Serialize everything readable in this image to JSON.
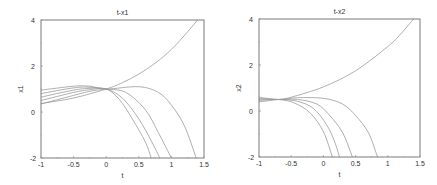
{
  "chart_data": [
    {
      "type": "line",
      "title": "t-x1",
      "xlabel": "t",
      "ylabel": "x1",
      "xlim": [
        -1,
        1.5
      ],
      "ylim": [
        -2,
        4
      ],
      "xticks": [
        "-1",
        "-0.5",
        "0",
        "0.5",
        "1",
        "1.5"
      ],
      "yticks": [
        "-2",
        "0",
        "2",
        "4"
      ],
      "grid": false,
      "legend": null,
      "series": [
        {
          "name": "upper",
          "points": [
            [
              -1,
              0.37
            ],
            [
              -0.5,
              0.61
            ],
            [
              0,
              1.0
            ],
            [
              0.25,
              1.28
            ],
            [
              0.5,
              1.65
            ],
            [
              0.75,
              2.12
            ],
            [
              1.0,
              2.72
            ],
            [
              1.25,
              3.49
            ],
            [
              1.4,
              4.0
            ]
          ]
        },
        {
          "name": "c1",
          "points": [
            [
              -1,
              0.95
            ],
            [
              -0.5,
              1.12
            ],
            [
              -0.25,
              1.12
            ],
            [
              0,
              1.0
            ],
            [
              0.5,
              1.1
            ],
            [
              0.8,
              0.85
            ],
            [
              1.0,
              0.3
            ],
            [
              1.2,
              -0.6
            ],
            [
              1.38,
              -2.0
            ]
          ]
        },
        {
          "name": "c2",
          "points": [
            [
              -1,
              0.8
            ],
            [
              -0.5,
              1.05
            ],
            [
              -0.25,
              1.08
            ],
            [
              0,
              1.0
            ],
            [
              0.3,
              0.85
            ],
            [
              0.6,
              0.1
            ],
            [
              0.8,
              -0.9
            ],
            [
              1.0,
              -2.0
            ]
          ]
        },
        {
          "name": "c3",
          "points": [
            [
              -1,
              0.65
            ],
            [
              -0.5,
              0.95
            ],
            [
              -0.25,
              1.03
            ],
            [
              0,
              1.0
            ],
            [
              0.25,
              0.6
            ],
            [
              0.5,
              -0.3
            ],
            [
              0.7,
              -1.3
            ],
            [
              0.82,
              -2.0
            ]
          ]
        },
        {
          "name": "c4",
          "points": [
            [
              -1,
              0.5
            ],
            [
              -0.5,
              0.85
            ],
            [
              -0.25,
              0.97
            ],
            [
              0,
              1.0
            ],
            [
              0.2,
              0.55
            ],
            [
              0.4,
              -0.3
            ],
            [
              0.6,
              -1.3
            ],
            [
              0.69,
              -2.0
            ]
          ]
        },
        {
          "name": "c5",
          "points": [
            [
              -1,
              0.35
            ],
            [
              -0.5,
              0.72
            ],
            [
              -0.25,
              0.9
            ],
            [
              0,
              1.0
            ]
          ]
        }
      ]
    },
    {
      "type": "line",
      "title": "t-x2",
      "xlabel": "t",
      "ylabel": "x2",
      "xlim": [
        -1,
        1.5
      ],
      "ylim": [
        -2,
        4
      ],
      "xticks": [
        "-1",
        "-0.5",
        "0",
        "0.5",
        "1",
        "1.5"
      ],
      "yticks": [
        "-2",
        "0",
        "2",
        "4"
      ],
      "grid": false,
      "legend": null,
      "series": [
        {
          "name": "upper",
          "points": [
            [
              -1,
              0.4
            ],
            [
              -0.7,
              0.5
            ],
            [
              -0.5,
              0.6
            ],
            [
              0,
              1.05
            ],
            [
              0.5,
              1.75
            ],
            [
              1.0,
              2.8
            ],
            [
              1.2,
              3.35
            ],
            [
              1.4,
              4.0
            ]
          ]
        },
        {
          "name": "c1",
          "points": [
            [
              -1,
              0.6
            ],
            [
              -0.7,
              0.5
            ],
            [
              -0.4,
              0.58
            ],
            [
              0,
              0.55
            ],
            [
              0.3,
              0.3
            ],
            [
              0.5,
              -0.2
            ],
            [
              0.7,
              -0.95
            ],
            [
              0.84,
              -2.0
            ]
          ]
        },
        {
          "name": "c2",
          "points": [
            [
              -1,
              0.55
            ],
            [
              -0.7,
              0.5
            ],
            [
              -0.4,
              0.5
            ],
            [
              -0.1,
              0.3
            ],
            [
              0.1,
              -0.2
            ],
            [
              0.3,
              -0.95
            ],
            [
              0.45,
              -2.0
            ]
          ]
        },
        {
          "name": "c3",
          "points": [
            [
              -1,
              0.5
            ],
            [
              -0.7,
              0.5
            ],
            [
              -0.4,
              0.42
            ],
            [
              -0.15,
              0.1
            ],
            [
              0.05,
              -0.6
            ],
            [
              0.17,
              -1.3
            ],
            [
              0.25,
              -2.0
            ]
          ]
        },
        {
          "name": "c4",
          "points": [
            [
              -1,
              0.45
            ],
            [
              -0.7,
              0.5
            ],
            [
              -0.45,
              0.35
            ],
            [
              -0.2,
              -0.1
            ],
            [
              0.0,
              -0.9
            ],
            [
              0.14,
              -2.0
            ]
          ]
        }
      ]
    }
  ]
}
